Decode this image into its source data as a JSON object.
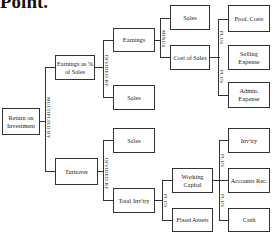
{
  "title": "Point.",
  "boxes": {
    "roi": "Return on Investment",
    "earnings_pct_sales": "Earnings as % of Sales",
    "turnover": "Turnover",
    "earnings": "Earnings",
    "sales_mid": "Sales",
    "sales_turnover": "Sales",
    "total_invtry": "Total Inv'try",
    "sales_top": "Sales",
    "cost_of_sales": "Cost of Sales",
    "working_capital": "Working Capital",
    "fixed_assets": "Fixed Assets",
    "prod_costs": "Prod. Costs",
    "selling_expense": "Selling Expense",
    "admin_expense": "Admin. Expense",
    "invtry": "Inv'try",
    "accounts_rec": "Accounts Rec.",
    "cash": "Cash"
  },
  "operators": {
    "multiplied_by": "MULTIPLIED BY",
    "divided_by_1": "DIVIDED BY",
    "divided_by_2": "DIVIDED BY",
    "minus": "MINUS",
    "plus_1": "PLUS",
    "plus_2": "PLUS",
    "plus_3": "PLUS",
    "plus_4": "PLUS",
    "plus_5": "PLUS"
  }
}
